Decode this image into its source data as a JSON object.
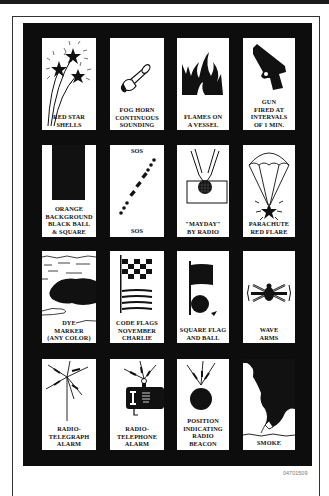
{
  "figure_code": "04701509",
  "signals": [
    {
      "label": "RED STAR\nSHELLS",
      "icon": "red-star-shells-icon"
    },
    {
      "label": "FOG HORN\nCONTINUOUS\nSOUNDING",
      "icon": "fog-horn-icon"
    },
    {
      "label": "FLAMES ON\nA VESSEL",
      "icon": "flames-icon"
    },
    {
      "label": "GUN\nFIRED AT\nINTERVALS\nOF 1 MIN.",
      "icon": "gun-icon"
    },
    {
      "label": "ORANGE\nBACKGROUND\nBLACK BALL\n& SQUARE",
      "icon": "orange-background-icon"
    },
    {
      "label": "SOS",
      "top_label": "SOS",
      "icon": "sos-morse-icon"
    },
    {
      "label": "\"MAYDAY\"\nBY RADIO",
      "icon": "mayday-radio-icon"
    },
    {
      "label": "PARACHUTE\nRED FLARE",
      "icon": "parachute-flare-icon"
    },
    {
      "label": "DYE\nMARKER\n(ANY COLOR)",
      "icon": "dye-marker-icon"
    },
    {
      "label": "CODE FLAGS\nNOVEMBER\nCHARLIE",
      "icon": "code-flags-icon"
    },
    {
      "label": "SQUARE FLAG\nAND BALL",
      "icon": "square-flag-ball-icon"
    },
    {
      "label": "WAVE\nARMS",
      "icon": "wave-arms-icon"
    },
    {
      "label": "RADIO-\nTELEGRAPH\nALARM",
      "icon": "radiotelegraph-icon"
    },
    {
      "label": "RADIO-\nTELEPHONE\nALARM",
      "icon": "radiotelephone-icon"
    },
    {
      "label": "POSITION\nINDICATING\nRADIO\nBEACON",
      "icon": "epirb-beacon-icon"
    },
    {
      "label": "SMOKE",
      "icon": "smoke-icon"
    }
  ]
}
